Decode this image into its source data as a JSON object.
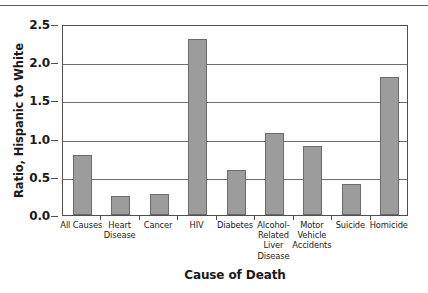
{
  "chart_data": {
    "type": "bar",
    "title": "",
    "xlabel": "Cause of Death",
    "ylabel": "Ratio, Hispanic to White",
    "categories": [
      "All Causes",
      "Heart Disease",
      "Cancer",
      "HIV",
      "Diabetes",
      "Alcohol-Related Liver Disease",
      "Motor Vehicle Accidents",
      "Suicide",
      "Homicide"
    ],
    "category_lines": [
      [
        "All Causes"
      ],
      [
        "Heart",
        "Disease"
      ],
      [
        "Cancer"
      ],
      [
        "HIV"
      ],
      [
        "Diabetes"
      ],
      [
        "Alcohol-",
        "Related",
        "Liver",
        "Disease"
      ],
      [
        "Motor",
        "Vehicle",
        "Accidents"
      ],
      [
        "Suicide"
      ],
      [
        "Homicide"
      ]
    ],
    "values": [
      0.79,
      0.25,
      0.27,
      2.3,
      0.59,
      1.08,
      0.9,
      0.4,
      1.81
    ],
    "ylim": [
      0.0,
      2.5
    ],
    "ytick_labels": [
      "0.0",
      "0.5",
      "1.0",
      "1.5",
      "2.0",
      "2.5"
    ],
    "ytick_values": [
      0.0,
      0.5,
      1.0,
      1.5,
      2.0,
      2.5
    ],
    "grid": "horizontal",
    "legend": "none",
    "bar_color": "#9c9c9c",
    "bar_border_color": "#6b6b6b",
    "axis_color": "#4f4f4f",
    "gridline_color": "#6e6e6e",
    "background_color": "#ffffff"
  }
}
